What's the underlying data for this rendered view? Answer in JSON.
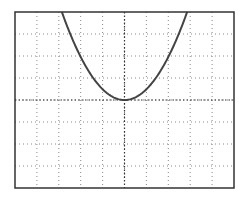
{
  "chart_data": {
    "type": "line",
    "title": "",
    "xlabel": "",
    "ylabel": "",
    "grid": true,
    "grid_style": "dotted",
    "x_divisions": 10,
    "y_divisions": 8,
    "xlim": [
      -5,
      5
    ],
    "ylim": [
      -4,
      4
    ],
    "center_axes": true,
    "legend": null,
    "series": [
      {
        "name": "parabola",
        "equation": "y = 0.49*x^2",
        "vertex": [
          0,
          0
        ],
        "x": [
          -2.86,
          -2.5,
          -2,
          -1.5,
          -1,
          -0.5,
          0,
          0.5,
          1,
          1.5,
          2,
          2.5,
          2.86
        ],
        "y": [
          4.0,
          3.06,
          1.96,
          1.1,
          0.49,
          0.12,
          0,
          0.12,
          0.49,
          1.1,
          1.96,
          3.06,
          4.0
        ],
        "color": "#444444"
      }
    ]
  },
  "colors": {
    "frame": "#333333",
    "grid": "#888888",
    "curve": "#444444",
    "background": "#ffffff"
  }
}
